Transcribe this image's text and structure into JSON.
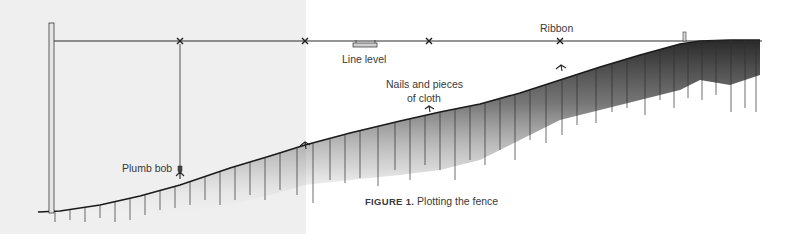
{
  "figure": {
    "caption_prefix": "FIGURE 1.",
    "caption_text": " Plotting the fence"
  },
  "labels": {
    "ribbon": "Ribbon",
    "line_level": "Line level",
    "nails_line1": "Nails and pieces",
    "nails_line2": "of cloth",
    "plumb_bob": "Plumb bob"
  },
  "colors": {
    "ink": "#2b2b2b",
    "left_panel_bg": "#efefef",
    "background": "#ffffff"
  }
}
